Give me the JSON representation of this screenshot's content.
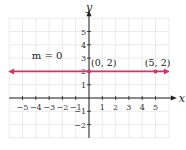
{
  "chart_data": {
    "type": "line",
    "title": "",
    "xlabel": "x",
    "ylabel": "y",
    "xlim": [
      -6,
      6
    ],
    "ylim": [
      -3,
      6
    ],
    "grid": true,
    "x_ticks": [
      -5,
      -4,
      -3,
      -2,
      -1,
      1,
      2,
      3,
      4,
      5
    ],
    "y_ticks": [
      -2,
      -1,
      1,
      2,
      3,
      4,
      5
    ],
    "series": [
      {
        "name": "y = 2",
        "equation": "y = 2",
        "color": "#d6336c",
        "x": [
          -6,
          6
        ],
        "y": [
          2,
          2
        ],
        "arrows_both_ends": true
      }
    ],
    "points": [
      {
        "label": "(0, 2)",
        "x": 0,
        "y": 2
      },
      {
        "label": "(5, 2)",
        "x": 5,
        "y": 2
      }
    ],
    "annotations": [
      {
        "text": "m = 0",
        "x": -3.5,
        "y": 2.8
      }
    ]
  },
  "labels": {
    "x_axis": "x",
    "y_axis": "y",
    "slope": "m = 0",
    "point_a": "(0, 2)",
    "point_b": "(5, 2)"
  },
  "colors": {
    "line": "#d6336c",
    "axis": "#222222",
    "grid": "#d8d8d8"
  }
}
